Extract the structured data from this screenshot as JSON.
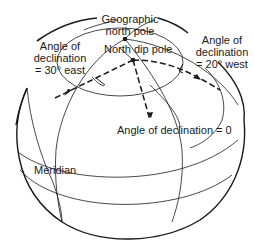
{
  "figure": {
    "labels": {
      "geographic_pole_line1": "Geographic",
      "geographic_pole_line2": "north pole",
      "dip_pole": "North dip pole",
      "decl_east_line1": "Angle of",
      "decl_east_line2": "declination",
      "decl_east_line3": "= 30° east",
      "decl_west_line1": "Angle of",
      "decl_west_line2": "declination",
      "decl_west_line3": "= 20° west",
      "decl_zero": "Angle of declination = 0",
      "meridian": "Meridian"
    },
    "colors": {
      "line": "#1a1a1a",
      "background": "#ffffff"
    }
  }
}
